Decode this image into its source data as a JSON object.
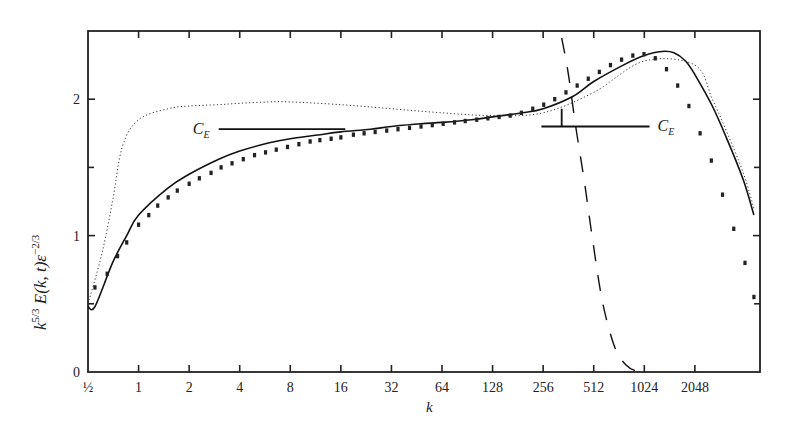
{
  "chart_data": {
    "type": "line",
    "title": "",
    "xlabel": "k",
    "ylabel": "k^{5/3} E(k,t) ε^{-2/3}",
    "ylabel_parts": {
      "base1": "k",
      "exp1": "5/3",
      "mid": " E(k, t)ε",
      "exp2": "−2/3"
    },
    "x_scale": "log2",
    "x_ticks": [
      "½",
      "1",
      "2",
      "4",
      "8",
      "16",
      "32",
      "64",
      "128",
      "256",
      "512",
      "1024",
      "2048"
    ],
    "x_tick_values": [
      0.5,
      1,
      2,
      4,
      8,
      16,
      32,
      64,
      128,
      256,
      512,
      1024,
      2048
    ],
    "y_ticks": [
      "0",
      "1",
      "2"
    ],
    "y_tick_values": [
      0,
      1,
      2
    ],
    "y_minor_ticks": [
      0.5,
      1.5
    ],
    "xlim": [
      0.5,
      5000
    ],
    "ylim": [
      0,
      2.5
    ],
    "grid": false,
    "legend": null,
    "annotations": [
      {
        "text": "C_E",
        "label_main": "C",
        "label_sub": "E",
        "y": 1.78,
        "x_from": 3.0,
        "x_to": 17,
        "side": "left"
      },
      {
        "text": "C_E",
        "label_main": "C",
        "label_sub": "E",
        "y": 1.8,
        "x_from": 250,
        "x_to": 1100,
        "side": "right"
      }
    ],
    "series": [
      {
        "name": "solid",
        "style": "solid",
        "x": [
          0.5,
          0.55,
          0.7,
          0.85,
          1,
          1.5,
          2,
          3,
          4,
          6,
          8,
          12,
          16,
          24,
          32,
          48,
          64,
          96,
          128,
          192,
          256,
          384,
          512,
          768,
          1024,
          1300,
          1536,
          1800,
          2048,
          2600,
          3200,
          4000,
          4600
        ],
        "y": [
          0.48,
          0.48,
          0.8,
          1.0,
          1.15,
          1.35,
          1.45,
          1.56,
          1.62,
          1.68,
          1.71,
          1.74,
          1.76,
          1.78,
          1.8,
          1.82,
          1.83,
          1.85,
          1.87,
          1.9,
          1.93,
          2.02,
          2.13,
          2.25,
          2.32,
          2.35,
          2.34,
          2.28,
          2.18,
          1.95,
          1.7,
          1.4,
          1.15
        ]
      },
      {
        "name": "dotted",
        "style": "dotted",
        "x": [
          0.5,
          0.6,
          0.7,
          0.8,
          1,
          1.5,
          2,
          3,
          4,
          6,
          8,
          16,
          32,
          64,
          128,
          256,
          512,
          1024,
          2048,
          2600,
          3200,
          4000,
          4600
        ],
        "y": [
          0.5,
          0.85,
          1.25,
          1.65,
          1.85,
          1.93,
          1.95,
          1.96,
          1.97,
          1.98,
          1.98,
          1.96,
          1.93,
          1.9,
          1.88,
          1.9,
          2.05,
          2.28,
          2.25,
          2.0,
          1.75,
          1.45,
          1.2
        ]
      },
      {
        "name": "squares",
        "style": "square-markers",
        "x": [
          0.55,
          0.65,
          0.75,
          0.85,
          1,
          1.15,
          1.3,
          1.5,
          1.7,
          2,
          2.3,
          2.7,
          3.1,
          3.6,
          4.2,
          4.9,
          5.7,
          6.6,
          7.7,
          9,
          10.5,
          12,
          14,
          16,
          19,
          22,
          25.6,
          30,
          35,
          41,
          48,
          56,
          65,
          76,
          88,
          103,
          120,
          140,
          163,
          190,
          222,
          258,
          300,
          350,
          408,
          475,
          553,
          644,
          750,
          875,
          1020,
          1190,
          1388,
          1618,
          1887,
          2200,
          2566,
          2992,
          3490,
          4070,
          4600
        ],
        "y": [
          0.62,
          0.72,
          0.85,
          0.95,
          1.08,
          1.15,
          1.22,
          1.28,
          1.33,
          1.38,
          1.42,
          1.46,
          1.5,
          1.53,
          1.56,
          1.59,
          1.61,
          1.63,
          1.65,
          1.67,
          1.69,
          1.7,
          1.71,
          1.72,
          1.74,
          1.75,
          1.76,
          1.77,
          1.78,
          1.79,
          1.8,
          1.81,
          1.82,
          1.83,
          1.84,
          1.85,
          1.86,
          1.87,
          1.88,
          1.9,
          1.93,
          1.96,
          2.0,
          2.05,
          2.1,
          2.15,
          2.2,
          2.25,
          2.29,
          2.32,
          2.33,
          2.3,
          2.22,
          2.1,
          1.95,
          1.75,
          1.55,
          1.3,
          1.05,
          0.8,
          0.55
        ]
      },
      {
        "name": "dashed",
        "style": "dashed",
        "x": [
          330,
          360,
          400,
          450,
          500,
          560,
          620,
          700,
          800,
          900,
          1000
        ],
        "y": [
          2.45,
          2.2,
          1.8,
          1.4,
          1.0,
          0.6,
          0.35,
          0.15,
          0.05,
          0.01,
          0.0
        ]
      }
    ],
    "vertical_marker": {
      "x": 330,
      "y_from": 1.8,
      "y_to": 1.93
    }
  }
}
